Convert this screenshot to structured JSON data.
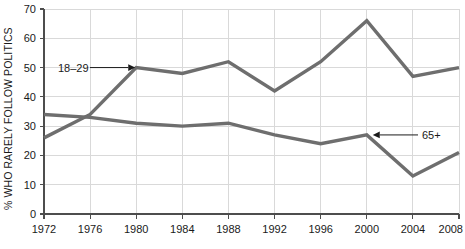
{
  "chart_data": {
    "type": "line",
    "title": "",
    "xlabel": "",
    "ylabel": "% WHO RARELY FOLLOW POLITICS",
    "x": [
      1972,
      1976,
      1980,
      1984,
      1988,
      1992,
      1996,
      2000,
      2004,
      2008
    ],
    "categories": [
      "1972",
      "1976",
      "1980",
      "1984",
      "1988",
      "1992",
      "1996",
      "2000",
      "2004",
      "2008"
    ],
    "xlim": [
      1972,
      2008
    ],
    "ylim": [
      0,
      70
    ],
    "yticks": [
      0,
      10,
      20,
      30,
      40,
      50,
      60,
      70
    ],
    "ytick_labels": [
      "0",
      "10",
      "20",
      "30",
      "40",
      "50",
      "60",
      "70"
    ],
    "grid": true,
    "legend": "none",
    "series": [
      {
        "name": "18-29",
        "label": "18–29",
        "color": "#6e6e6e",
        "values": [
          26,
          34,
          50,
          48,
          52,
          42,
          52,
          66,
          47,
          50
        ]
      },
      {
        "name": "65+",
        "label": "65+",
        "color": "#6e6e6e",
        "values": [
          34,
          33,
          31,
          30,
          31,
          27,
          24,
          27,
          13,
          21
        ]
      }
    ],
    "annotations": [
      {
        "name": "annotation-18-29",
        "text": "18–29",
        "points_to_year": 1980,
        "points_to_value": 50,
        "arrow_direction": "right"
      },
      {
        "name": "annotation-65-plus",
        "text": "65+",
        "points_to_year": 2000,
        "points_to_value": 27,
        "arrow_direction": "left"
      }
    ]
  },
  "colors": {
    "line": "#6e6e6e",
    "grid": "#d9d9d9",
    "axis": "#4d4d4d",
    "text": "#1a1a1a",
    "background": "#ffffff"
  }
}
